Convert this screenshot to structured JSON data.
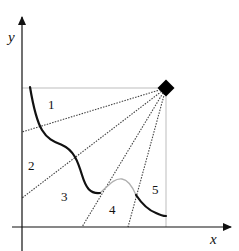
{
  "diagram": {
    "axes": {
      "x_label": "x",
      "y_label": "y"
    },
    "regions": [
      {
        "id": 1,
        "label": "1"
      },
      {
        "id": 2,
        "label": "2"
      },
      {
        "id": 3,
        "label": "3"
      },
      {
        "id": 4,
        "label": "4"
      },
      {
        "id": 5,
        "label": "5"
      }
    ],
    "source_point": {
      "shape": "diamond",
      "color": "#000000"
    },
    "colors": {
      "axis": "#111111",
      "curve": "#111111",
      "hidden_curve": "#b0b0b0",
      "guide": "#bdbdbd",
      "ray": "#444444"
    }
  }
}
